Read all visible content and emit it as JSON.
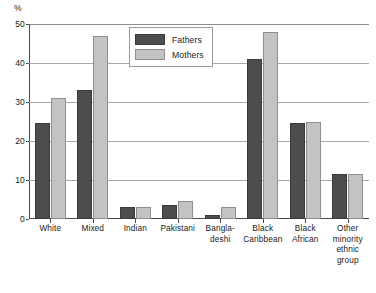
{
  "chart_data": {
    "type": "bar",
    "title": "",
    "xlabel": "",
    "ylabel": "%",
    "ylim": [
      0,
      50
    ],
    "yticks": [
      0,
      10,
      20,
      30,
      40,
      50
    ],
    "grid": true,
    "legend_position": "top-center",
    "categories": [
      "White",
      "Mixed",
      "Indian",
      "Pakistani",
      "Bangladeshi",
      "Black Caribbean",
      "Black African",
      "Other minority ethnic group"
    ],
    "category_label_lines": [
      [
        "White"
      ],
      [
        "Mixed"
      ],
      [
        "Indian"
      ],
      [
        "Pakistani"
      ],
      [
        "Bangla-",
        "deshi"
      ],
      [
        "Black",
        "Caribbean"
      ],
      [
        "Black",
        "African"
      ],
      [
        "Other",
        "minority",
        "ethnic group"
      ]
    ],
    "series": [
      {
        "name": "Fathers",
        "color": "#4d4d4d",
        "values": [
          24.5,
          33,
          3,
          3.5,
          1,
          41,
          24.5,
          11.5
        ]
      },
      {
        "name": "Mothers",
        "color": "#c3c3c3",
        "values": [
          31,
          47,
          3,
          4.5,
          3,
          48,
          25,
          11.5
        ]
      }
    ]
  },
  "axis": {
    "unit_label": "%",
    "tick_labels": [
      "0",
      "10",
      "20",
      "30",
      "40",
      "50"
    ]
  },
  "legend": {
    "items": [
      {
        "label": "Fathers"
      },
      {
        "label": "Mothers"
      }
    ]
  },
  "caption": {
    "text": ""
  }
}
